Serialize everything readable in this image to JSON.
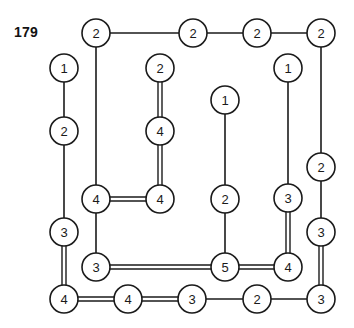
{
  "figure": {
    "number_label": "179",
    "number_label_x": 14,
    "number_label_y": 24,
    "width": 354,
    "height": 328,
    "background_color": "#ffffff",
    "stroke_color": "#1a1a1a"
  },
  "graph": {
    "node_radius": 14,
    "single_edge_width": 1.6,
    "double_edge_width": 1.4,
    "double_edge_gap": 4,
    "nodes": [
      {
        "id": "n1",
        "label": "2",
        "x": 96,
        "y": 33
      },
      {
        "id": "n2",
        "label": "2",
        "x": 193,
        "y": 33
      },
      {
        "id": "n3",
        "label": "2",
        "x": 257,
        "y": 33
      },
      {
        "id": "n4",
        "label": "2",
        "x": 321,
        "y": 33
      },
      {
        "id": "n5",
        "label": "1",
        "x": 64,
        "y": 68
      },
      {
        "id": "n6",
        "label": "2",
        "x": 160,
        "y": 68
      },
      {
        "id": "n7",
        "label": "1",
        "x": 288,
        "y": 68
      },
      {
        "id": "n8",
        "label": "2",
        "x": 64,
        "y": 131
      },
      {
        "id": "n9",
        "label": "4",
        "x": 160,
        "y": 131
      },
      {
        "id": "n10",
        "label": "1",
        "x": 225,
        "y": 100
      },
      {
        "id": "n11",
        "label": "2",
        "x": 321,
        "y": 167
      },
      {
        "id": "n12",
        "label": "4",
        "x": 96,
        "y": 199
      },
      {
        "id": "n13",
        "label": "4",
        "x": 160,
        "y": 199
      },
      {
        "id": "n14",
        "label": "2",
        "x": 225,
        "y": 199
      },
      {
        "id": "n15",
        "label": "3",
        "x": 288,
        "y": 198
      },
      {
        "id": "n16",
        "label": "3",
        "x": 64,
        "y": 232
      },
      {
        "id": "n17",
        "label": "3",
        "x": 321,
        "y": 232
      },
      {
        "id": "n18",
        "label": "3",
        "x": 96,
        "y": 267
      },
      {
        "id": "n19",
        "label": "5",
        "x": 225,
        "y": 267
      },
      {
        "id": "n20",
        "label": "4",
        "x": 288,
        "y": 267
      },
      {
        "id": "n21",
        "label": "4",
        "x": 64,
        "y": 299
      },
      {
        "id": "n22",
        "label": "4",
        "x": 128,
        "y": 299
      },
      {
        "id": "n23",
        "label": "3",
        "x": 192,
        "y": 299
      },
      {
        "id": "n24",
        "label": "2",
        "x": 257,
        "y": 299
      },
      {
        "id": "n25",
        "label": "3",
        "x": 321,
        "y": 299
      }
    ],
    "edges": [
      {
        "from": "n1",
        "to": "n2",
        "multiplicity": 1
      },
      {
        "from": "n2",
        "to": "n3",
        "multiplicity": 1
      },
      {
        "from": "n3",
        "to": "n4",
        "multiplicity": 1
      },
      {
        "from": "n1",
        "to": "n12",
        "multiplicity": 1
      },
      {
        "from": "n5",
        "to": "n8",
        "multiplicity": 1
      },
      {
        "from": "n8",
        "to": "n16",
        "multiplicity": 1
      },
      {
        "from": "n6",
        "to": "n9",
        "multiplicity": 2
      },
      {
        "from": "n9",
        "to": "n13",
        "multiplicity": 2
      },
      {
        "from": "n12",
        "to": "n13",
        "multiplicity": 2
      },
      {
        "from": "n12",
        "to": "n18",
        "multiplicity": 1
      },
      {
        "from": "n10",
        "to": "n14",
        "multiplicity": 1
      },
      {
        "from": "n14",
        "to": "n19",
        "multiplicity": 1
      },
      {
        "from": "n7",
        "to": "n15",
        "multiplicity": 1
      },
      {
        "from": "n15",
        "to": "n20",
        "multiplicity": 2
      },
      {
        "from": "n4",
        "to": "n11",
        "multiplicity": 1
      },
      {
        "from": "n11",
        "to": "n17",
        "multiplicity": 1
      },
      {
        "from": "n17",
        "to": "n25",
        "multiplicity": 2
      },
      {
        "from": "n16",
        "to": "n21",
        "multiplicity": 2
      },
      {
        "from": "n18",
        "to": "n19",
        "multiplicity": 2
      },
      {
        "from": "n19",
        "to": "n20",
        "multiplicity": 2
      },
      {
        "from": "n21",
        "to": "n22",
        "multiplicity": 2
      },
      {
        "from": "n22",
        "to": "n23",
        "multiplicity": 2
      },
      {
        "from": "n23",
        "to": "n24",
        "multiplicity": 1
      },
      {
        "from": "n24",
        "to": "n25",
        "multiplicity": 1
      }
    ]
  }
}
